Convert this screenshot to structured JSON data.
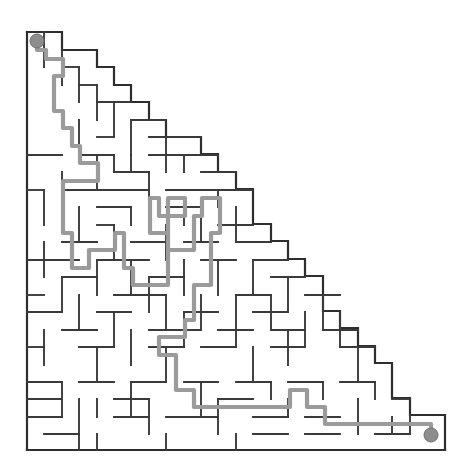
{
  "figure": {
    "kind": "maze-puzzle",
    "shape": "right-triangle",
    "title": "",
    "background_color": "#ffffff",
    "wall_color": "#3a3a3a",
    "border_color": "#2e2e2e",
    "solution_color": "#9b9b9b",
    "marker_color": "#8d8d8d"
  },
  "grid": {
    "origin_x": 27,
    "origin_y": 32,
    "cell": 17.42,
    "cols": 24,
    "rows": 24,
    "note": "right triangle: legs on left edge and bottom edge, hypotenuse is a descending staircase from top-left to bottom-right"
  },
  "endpoints": {
    "start": {
      "label": "start",
      "col": 0,
      "row": 0,
      "cx": 37,
      "cy": 41,
      "radius": 7
    },
    "finish": {
      "label": "finish",
      "col": 23,
      "row": 23,
      "cx": 431,
      "cy": 435,
      "radius": 7
    }
  },
  "solution_path": {
    "label": "solution",
    "points": "37,41 37,50 46,50 46,59 63,59 63,76 54,76 54,111 63,111 63,128 72,128 72,146 80,146 80,163 98,163 98,181 63,181 63,233 72,233 72,268 89,268 89,250 115,250 115,233 124,233 124,268 133,268 133,285 168,285 168,216 185,216 185,198 168,198 168,216 159,216 159,198 150,198 150,233 168,233 168,250 194,250 194,216 202,216 202,198 220,198 220,233 211,233 211,285 194,285 194,320 185,320 185,337 159,337 159,355 176,355 176,390 194,390 194,407 290,407 290,390 307,390 307,407 325,407 325,424 431,424 431,435",
    "description": "Path descends from the top-left start, serpentines through the central chambers, then drops to the bottom row and runs east to the finish."
  },
  "icons": {
    "start_marker": "circle-marker-icon",
    "finish_marker": "circle-marker-icon"
  }
}
